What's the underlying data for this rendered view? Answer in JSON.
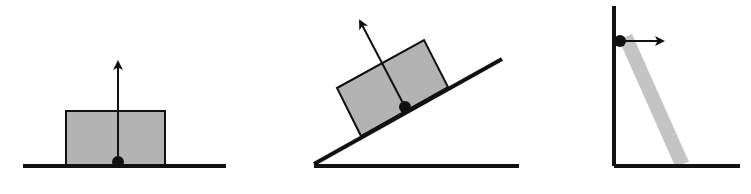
{
  "diagram": {
    "title": "",
    "colors": {
      "line": "#111111",
      "block_fill": "#b3b3b3",
      "rod_fill": "#c4c4c4",
      "background": "#ffffff"
    },
    "panels": [
      {
        "id": "block-on-floor",
        "ground": {
          "x1": 23,
          "y1": 166,
          "x2": 226,
          "y2": 166
        },
        "block": {
          "points": "66,111 165,111 165,166 66,166"
        },
        "contact_point": {
          "cx": 118,
          "cy": 162,
          "r": 6
        },
        "force_arrow": {
          "x1": 118,
          "y1": 162,
          "x2": 118,
          "y2": 62,
          "direction": "up"
        }
      },
      {
        "id": "block-on-incline",
        "ground": {
          "x1": 314,
          "y1": 166,
          "x2": 519,
          "y2": 166
        },
        "incline": {
          "x1": 314,
          "y1": 164,
          "x2": 502,
          "y2": 59
        },
        "block": {
          "points": "337,88 424,40 448,87 361,136"
        },
        "contact_point": {
          "cx": 405,
          "cy": 107,
          "r": 6
        },
        "force_arrow": {
          "x1": 405,
          "y1": 107,
          "x2": 360,
          "y2": 21,
          "direction": "perpendicular-to-incline"
        }
      },
      {
        "id": "rod-against-wall",
        "wall": {
          "x1": 614,
          "y1": 6,
          "x2": 614,
          "y2": 166
        },
        "ground": {
          "x1": 614,
          "y1": 166,
          "x2": 740,
          "y2": 166
        },
        "rod": {
          "points": "619,40 632,34 689,162 675,166"
        },
        "contact_point": {
          "cx": 620,
          "cy": 41,
          "r": 6
        },
        "force_arrow": {
          "x1": 620,
          "y1": 41,
          "x2": 663,
          "y2": 41,
          "direction": "right"
        }
      }
    ]
  }
}
